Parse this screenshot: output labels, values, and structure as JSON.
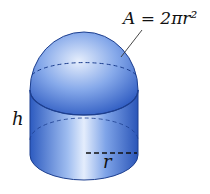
{
  "figure": {
    "formula_label": "A = 2πr²",
    "height_label": "h",
    "radius_label": "r",
    "colors": {
      "fill_dark": "#2f5fc4",
      "fill_mid": "#6f9be6",
      "fill_light": "#d9e6fb",
      "outline": "#1d3f8f"
    }
  }
}
